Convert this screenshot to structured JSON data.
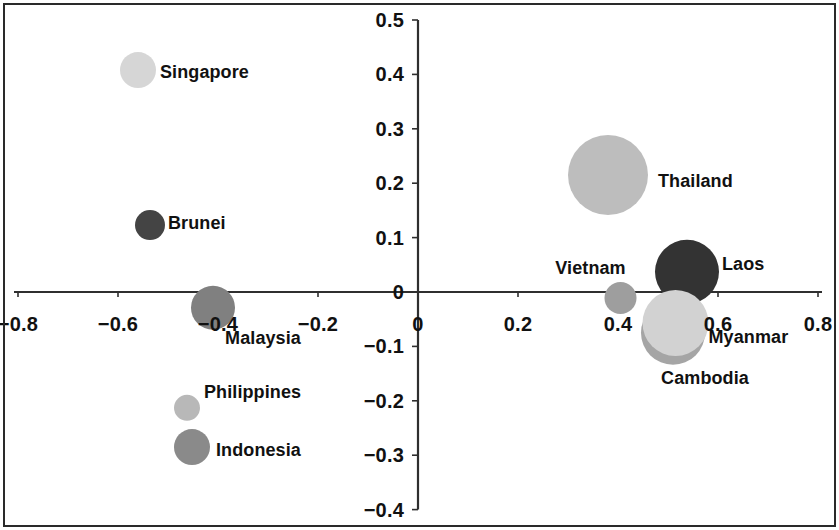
{
  "figure": {
    "title": "",
    "background_color": "#ffffff",
    "frame_color": "#2a2a2a",
    "axis_color": "#2f2f2f",
    "text_color": "#111111"
  },
  "axes": {
    "x_ticks": [
      "−0.8",
      "−0.6",
      "−0.4",
      "−0.2",
      "0",
      "0.2",
      "0.4",
      "0.6",
      "0.8"
    ],
    "y_ticks": [
      "0.5",
      "0.4",
      "0.3",
      "0.2",
      "0.1",
      "0",
      "−0.1",
      "−0.2",
      "−0.3",
      "−0.4"
    ],
    "x_zero_label": "0",
    "y_zero_label": "0"
  },
  "chart_data": {
    "type": "scatter",
    "title": "",
    "xlabel": "",
    "ylabel": "",
    "xlim": [
      -0.9,
      0.9
    ],
    "ylim": [
      -0.45,
      0.52
    ],
    "xticks": [
      -0.8,
      -0.6,
      -0.4,
      -0.2,
      0,
      0.2,
      0.4,
      0.6,
      0.8
    ],
    "yticks": [
      0.5,
      0.4,
      0.3,
      0.2,
      0.1,
      0,
      -0.1,
      -0.2,
      -0.3,
      -0.4
    ],
    "grid": false,
    "legend": "none",
    "marker_shape": "circle",
    "size_encodes": "bubble-radius",
    "points": [
      {
        "name": "Singapore",
        "x": -0.56,
        "y": 0.408,
        "r_px": 18,
        "color": "#d6d6d6",
        "label_pos": "right",
        "label_dx": 22,
        "label_dy": 2
      },
      {
        "name": "Brunei",
        "x": -0.536,
        "y": 0.123,
        "r_px": 15,
        "color": "#444444",
        "label_pos": "right",
        "label_dx": 18,
        "label_dy": -2
      },
      {
        "name": "Malaysia",
        "x": -0.41,
        "y": -0.029,
        "r_px": 22,
        "color": "#808080",
        "label_pos": "center",
        "label_dx": 50,
        "label_dy": 30
      },
      {
        "name": "Philippines",
        "x": -0.462,
        "y": -0.213,
        "r_px": 13,
        "color": "#b8b8b8",
        "label_pos": "left",
        "label_dx": 17,
        "label_dy": -16
      },
      {
        "name": "Indonesia",
        "x": -0.452,
        "y": -0.285,
        "r_px": 18,
        "color": "#8a8a8a",
        "label_pos": "left",
        "label_dx": 24,
        "label_dy": 3
      },
      {
        "name": "Thailand",
        "x": 0.38,
        "y": 0.215,
        "r_px": 40,
        "color": "#bdbdbd",
        "label_pos": "left",
        "label_dx": 50,
        "label_dy": 6
      },
      {
        "name": "Vietnam",
        "x": 0.405,
        "y": -0.011,
        "r_px": 16,
        "color": "#9e9e9e",
        "label_pos": "center",
        "label_dx": -30,
        "label_dy": -30
      },
      {
        "name": "Cambodia",
        "x": 0.51,
        "y": -0.075,
        "r_px": 32,
        "color": "#a5a5a5",
        "label_pos": "center",
        "label_dx": 32,
        "label_dy": 45
      },
      {
        "name": "Myanmar",
        "x": 0.515,
        "y": -0.057,
        "r_px": 33,
        "color": "#d2d2d2",
        "label_pos": "left",
        "label_dx": 33,
        "label_dy": 14
      },
      {
        "name": "Laos",
        "x": 0.538,
        "y": 0.037,
        "r_px": 32,
        "color": "#333333",
        "label_pos": "left",
        "label_dx": 35,
        "label_dy": -8
      }
    ],
    "draw_order": [
      "Singapore",
      "Brunei",
      "Malaysia",
      "Philippines",
      "Indonesia",
      "Thailand",
      "Vietnam",
      "Laos",
      "Cambodia",
      "Myanmar"
    ]
  }
}
